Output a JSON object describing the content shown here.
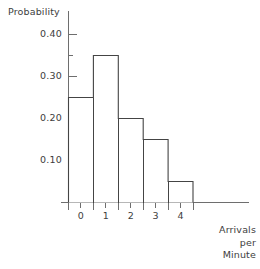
{
  "chart_data": {
    "type": "bar",
    "title": "",
    "subtitle": "",
    "xlabel": "Arrivals per Minute",
    "xlabel_lines": [
      "Arrivals",
      "per",
      "Minute"
    ],
    "ylabel": "Probability",
    "categories": [
      "0",
      "1",
      "2",
      "3",
      "4"
    ],
    "values": [
      0.25,
      0.35,
      0.2,
      0.15,
      0.05
    ],
    "series": [
      {
        "name": "Probability",
        "values": [
          0.25,
          0.35,
          0.2,
          0.15,
          0.05
        ]
      }
    ],
    "xlim": [
      -0.5,
      4.5
    ],
    "ylim": [
      0.0,
      0.425
    ],
    "ytick_labels": [
      "0.10",
      "0.20",
      "0.30",
      "0.40"
    ],
    "ytick_values": [
      0.1,
      0.2,
      0.3,
      0.4
    ],
    "yminor_tick_values": [
      0.05,
      0.15,
      0.25,
      0.35
    ],
    "xtick_labels": [
      "0",
      "1",
      "2",
      "3",
      "4"
    ],
    "xtick_values": [
      0,
      1,
      2,
      3,
      4
    ],
    "grid": false,
    "legend": false,
    "legend_position": "none",
    "bar_style": "histogram-outline",
    "bar_fill": "#ffffff",
    "bar_stroke": "#444444",
    "axis_color": "#6e6e6e",
    "text_color": "#3d3d3d",
    "background": "#ffffff",
    "annotations": []
  },
  "axes": {
    "y_title": "Probability",
    "x_title_lines": [
      "Arrivals",
      "per",
      "Minute"
    ]
  }
}
